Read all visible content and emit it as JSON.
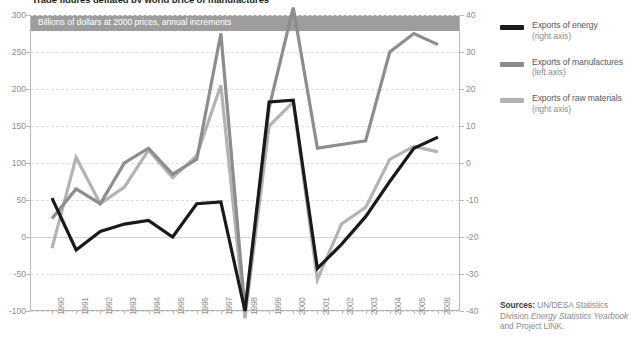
{
  "figure": {
    "top_title": "Trade figures deflated by world price of manufactures",
    "banner_label": "Billions of dollars at 2000 prices, annual increments"
  },
  "legend": {
    "items": [
      {
        "name": "Exports of energy",
        "axis": "(right axis)",
        "color": "#1a1a1a"
      },
      {
        "name": "Exports of manufactures",
        "axis": "(left axis)",
        "color": "#8d8d8d"
      },
      {
        "name": "Exports of raw materials",
        "axis": "(right axis)",
        "color": "#b3b3b3"
      }
    ]
  },
  "sources": {
    "label": "Sources:",
    "body_1": " UN/DESA Statistics Division ",
    "body_italic": "Energy Statistics Yearbook",
    "body_2": " and Project LINK."
  },
  "chart_data": {
    "type": "line",
    "title": "Trade figures deflated by world price of manufactures",
    "subtitle": "Billions of dollars at 2000 prices, annual increments",
    "xlabel": "",
    "ylabel": "Billions of dollars at 2000 prices",
    "grid": true,
    "legend_position": "right",
    "categories": [
      1990,
      1991,
      1992,
      1993,
      1994,
      1995,
      1996,
      1997,
      1998,
      1999,
      2000,
      2001,
      2002,
      2003,
      2004,
      2005,
      2006
    ],
    "left_axis": {
      "name": "Billions of dollars at 2000 prices",
      "ylim": [
        -100,
        300
      ],
      "ticks": [
        300,
        250,
        200,
        150,
        100,
        50,
        0,
        -50,
        -100
      ]
    },
    "right_axis": {
      "name": "Billions of dollars at 2000 prices",
      "ylim": [
        -40,
        40
      ],
      "ticks": [
        40,
        30,
        20,
        10,
        0,
        -10,
        -20,
        -30,
        -40
      ]
    },
    "series": [
      {
        "name": "Exports of energy",
        "axis": "right",
        "color": "#1a1a1a",
        "values": [
          -9.5,
          -23.5,
          -18.5,
          -16.5,
          -15.5,
          -20.0,
          -11.0,
          -10.5,
          -40.0,
          16.5,
          17.0,
          -28.5,
          -22.0,
          -14.5,
          -5.0,
          4.0,
          7.0
        ]
      },
      {
        "name": "Exports of manufactures",
        "axis": "left",
        "color": "#8d8d8d",
        "values": [
          25,
          65,
          45,
          100,
          120,
          85,
          105,
          275,
          -100,
          175,
          310,
          120,
          125,
          130,
          250,
          275,
          260
        ]
      },
      {
        "name": "Exports of raw materials",
        "axis": "right",
        "color": "#b3b3b3",
        "values": [
          -23.0,
          1.5,
          -11.0,
          -6.5,
          3.5,
          -4.0,
          2.0,
          21.0,
          -42.0,
          10.0,
          16.5,
          -31.5,
          -16.5,
          -12.0,
          1.0,
          4.5,
          3.0
        ]
      }
    ]
  }
}
